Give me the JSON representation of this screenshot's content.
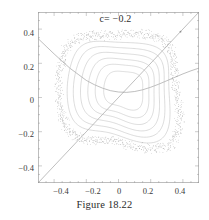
{
  "figure": {
    "title": "c= −0.2",
    "caption": "Figure 18.22"
  },
  "axes": {
    "x_ticklabels": [
      "−0.4",
      "−0.2",
      "0",
      "0.2",
      "0.4"
    ],
    "y_ticklabels": [
      "0.4",
      "0.2",
      "0",
      "−0.2",
      "−0.4"
    ]
  },
  "colors": {
    "frame": "#9a9a9a",
    "orbit": "#b9b9b9",
    "orbit_dark": "#8e8e8e",
    "line": "#8a8a8a",
    "text": "#2e2e2e",
    "background": "#ffffff"
  },
  "chart_data": {
    "type": "scatter",
    "title": "c= −0.2",
    "subtitle": "",
    "xlabel": "",
    "ylabel": "",
    "xlim": [
      -0.5,
      0.5
    ],
    "ylim": [
      -0.5,
      0.5
    ],
    "grid": false,
    "legend": null,
    "xticks": [
      -0.4,
      -0.2,
      0,
      0.2,
      0.4
    ],
    "yticks": [
      -0.4,
      -0.2,
      0,
      0.2,
      0.4
    ],
    "minor_tick_step": 0.05,
    "series": [
      {
        "name": "diagonal y=x",
        "type": "line",
        "points": [
          [
            -0.5,
            -0.5
          ],
          [
            0.5,
            0.5
          ]
        ]
      },
      {
        "name": "parabola y = 0.085 - 1.0*x^2 + 0.05*x",
        "type": "line",
        "points": [
          [
            -0.5,
            0.345
          ],
          [
            -0.45,
            0.3
          ],
          [
            -0.4,
            0.255
          ],
          [
            -0.35,
            0.212
          ],
          [
            -0.3,
            0.17
          ],
          [
            -0.25,
            0.135
          ],
          [
            -0.2,
            0.1
          ],
          [
            -0.15,
            0.075
          ],
          [
            -0.1,
            0.055
          ],
          [
            -0.05,
            0.04
          ],
          [
            0.0,
            0.032
          ],
          [
            0.05,
            0.03
          ],
          [
            0.1,
            0.035
          ],
          [
            0.15,
            0.045
          ],
          [
            0.2,
            0.06
          ],
          [
            0.25,
            0.078
          ],
          [
            0.3,
            0.098
          ],
          [
            0.35,
            0.118
          ],
          [
            0.4,
            0.138
          ],
          [
            0.45,
            0.156
          ],
          [
            0.5,
            0.172
          ]
        ]
      },
      {
        "name": "invariant curve 1 (innermost)",
        "type": "closed_curve",
        "center": [
          0.035,
          0.045
        ],
        "radius_x": 0.115,
        "radius_y": 0.11,
        "squareness": 0.55,
        "rotation_deg": -8
      },
      {
        "name": "invariant curve 2",
        "type": "closed_curve",
        "center": [
          0.03,
          0.045
        ],
        "radius_x": 0.158,
        "radius_y": 0.15,
        "squareness": 0.62,
        "rotation_deg": -8
      },
      {
        "name": "invariant curve 3",
        "type": "closed_curve",
        "center": [
          0.025,
          0.045
        ],
        "radius_x": 0.195,
        "radius_y": 0.185,
        "squareness": 0.68,
        "rotation_deg": -8
      },
      {
        "name": "invariant curve 4",
        "type": "closed_curve",
        "center": [
          0.02,
          0.045
        ],
        "radius_x": 0.232,
        "radius_y": 0.22,
        "squareness": 0.74,
        "rotation_deg": -7
      },
      {
        "name": "invariant curve 5",
        "type": "closed_curve",
        "center": [
          0.015,
          0.045
        ],
        "radius_x": 0.268,
        "radius_y": 0.255,
        "squareness": 0.8,
        "rotation_deg": -6
      },
      {
        "name": "invariant curve 6",
        "type": "closed_curve",
        "center": [
          0.012,
          0.045
        ],
        "radius_x": 0.3,
        "radius_y": 0.288,
        "squareness": 0.86,
        "rotation_deg": -5
      },
      {
        "name": "chaotic band (outer separatrix layer)",
        "type": "scatter_band",
        "center": [
          0.01,
          0.045
        ],
        "radius_x": 0.345,
        "radius_y": 0.335,
        "squareness": 0.94,
        "thickness": 0.022,
        "n_points": 900
      },
      {
        "name": "hyperbolic fixed point (upper right)",
        "type": "point",
        "points": [
          [
            0.385,
            0.385
          ]
        ]
      }
    ]
  }
}
